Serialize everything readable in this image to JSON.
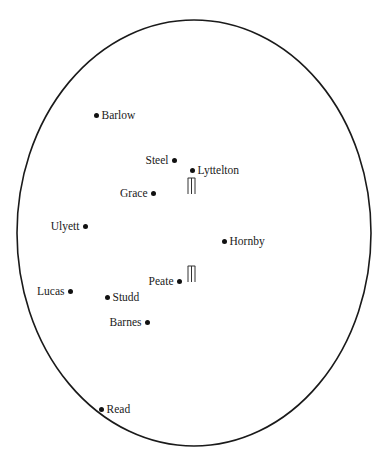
{
  "diagram": {
    "type": "cricket-field-placement",
    "boundary": {
      "shape": "ellipse",
      "cx": 194,
      "cy": 233,
      "rx": 177,
      "ry": 213,
      "stroke": "#1a1a1a"
    },
    "players": [
      {
        "name": "Barlow",
        "x": 96,
        "y": 115,
        "label_side": "right"
      },
      {
        "name": "Steel",
        "x": 174,
        "y": 160,
        "label_side": "left"
      },
      {
        "name": "Lyttelton",
        "x": 192,
        "y": 170,
        "label_side": "right"
      },
      {
        "name": "Grace",
        "x": 153,
        "y": 193,
        "label_side": "left"
      },
      {
        "name": "Ulyett",
        "x": 85,
        "y": 226,
        "label_side": "left"
      },
      {
        "name": "Hornby",
        "x": 224,
        "y": 241,
        "label_side": "right"
      },
      {
        "name": "Peate",
        "x": 179,
        "y": 281,
        "label_side": "left"
      },
      {
        "name": "Lucas",
        "x": 70,
        "y": 291,
        "label_side": "left"
      },
      {
        "name": "Studd",
        "x": 107,
        "y": 297,
        "label_side": "right"
      },
      {
        "name": "Barnes",
        "x": 147,
        "y": 322,
        "label_side": "left"
      },
      {
        "name": "Read",
        "x": 101,
        "y": 409,
        "label_side": "right"
      }
    ],
    "wickets": [
      {
        "name": "upper-wicket",
        "x": 187,
        "y": 177
      },
      {
        "name": "lower-wicket",
        "x": 187,
        "y": 265
      }
    ]
  }
}
